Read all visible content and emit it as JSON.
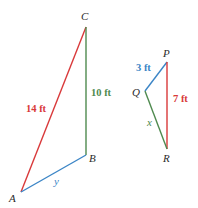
{
  "colors": {
    "red": "#d9393a",
    "green": "#4f8a4f",
    "blue": "#3b85c6",
    "vertex": "#2a2a2a"
  },
  "triangle_abc": {
    "vertices": {
      "A": {
        "label": "A",
        "x": 21,
        "y": 192
      },
      "B": {
        "label": "B",
        "x": 86,
        "y": 155
      },
      "C": {
        "label": "C",
        "x": 86,
        "y": 27
      }
    },
    "sides": {
      "AC": {
        "label": "14 ft",
        "color": "red"
      },
      "BC": {
        "label": "10 ft",
        "color": "green"
      },
      "AB": {
        "label": "y",
        "color": "blue"
      }
    }
  },
  "triangle_pqr": {
    "vertices": {
      "P": {
        "label": "P",
        "x": 167,
        "y": 62
      },
      "Q": {
        "label": "Q",
        "x": 145,
        "y": 91
      },
      "R": {
        "label": "R",
        "x": 167,
        "y": 149
      }
    },
    "sides": {
      "PQ": {
        "label": "3 ft",
        "color": "blue"
      },
      "PR": {
        "label": "7 ft",
        "color": "red"
      },
      "QR": {
        "label": "x",
        "color": "green"
      }
    }
  }
}
